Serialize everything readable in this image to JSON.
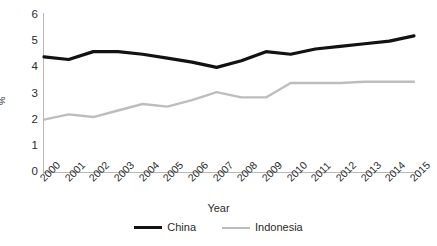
{
  "chart_data": {
    "type": "line",
    "title": "",
    "xlabel": "Year",
    "ylabel": "%",
    "categories": [
      "2000",
      "2001",
      "2002",
      "2003",
      "2004",
      "2005",
      "2006",
      "2007",
      "2008",
      "2009",
      "2010",
      "2011",
      "2012",
      "2013",
      "2014",
      "2015"
    ],
    "x": [
      2000,
      2001,
      2002,
      2003,
      2004,
      2005,
      2006,
      2007,
      2008,
      2009,
      2010,
      2011,
      2012,
      2013,
      2014,
      2015
    ],
    "ylim": [
      0,
      6
    ],
    "yticks": [
      0,
      1,
      2,
      3,
      4,
      5,
      6
    ],
    "xlim": [
      2000,
      2015
    ],
    "grid": false,
    "legend_position": "bottom-center",
    "series": [
      {
        "name": "China",
        "color": "#121212",
        "line_width": 3.2,
        "values": [
          4.4,
          4.3,
          4.6,
          4.6,
          4.5,
          4.35,
          4.2,
          4.0,
          4.25,
          4.6,
          4.5,
          4.7,
          4.8,
          4.9,
          5.0,
          5.2
        ]
      },
      {
        "name": "Indonesia",
        "color": "#bdbdbd",
        "line_width": 2.4,
        "values": [
          2.0,
          2.2,
          2.1,
          2.35,
          2.6,
          2.5,
          2.75,
          3.05,
          2.85,
          2.85,
          3.4,
          3.4,
          3.4,
          3.45,
          3.45,
          3.45
        ]
      }
    ]
  },
  "axis": {
    "y_title": "%",
    "x_title": "Year",
    "y_tick_labels": [
      "6",
      "5",
      "4",
      "3",
      "2",
      "1",
      "0"
    ],
    "x_tick_labels": [
      "2000",
      "2001",
      "2002",
      "2003",
      "2004",
      "2005",
      "2006",
      "2007",
      "2008",
      "2009",
      "2010",
      "2011",
      "2012",
      "2013",
      "2014",
      "2015"
    ]
  },
  "legend": {
    "items": [
      {
        "label": "China",
        "color": "#121212"
      },
      {
        "label": "Indonesia",
        "color": "#bdbdbd"
      }
    ]
  },
  "colors": {
    "china": "#121212",
    "indonesia": "#bdbdbd",
    "axis": "#b9b9b9",
    "text": "#2b2b2b",
    "background": "#ffffff"
  }
}
